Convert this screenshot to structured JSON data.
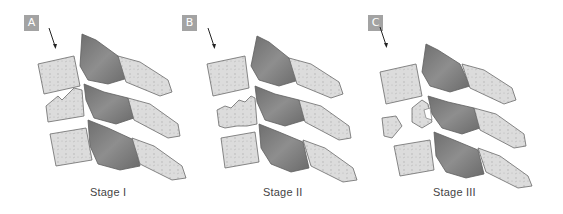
{
  "figure": {
    "colors": {
      "badge": "#a3a3a3",
      "bone_light": "#dcdcdc",
      "bone_dark": "#7d7d7d",
      "outline": "#6a6a6a",
      "caption": "#444444"
    },
    "panels": [
      {
        "id": "A",
        "badge": "A",
        "caption": "Stage  I",
        "stage": 1
      },
      {
        "id": "B",
        "badge": "B",
        "caption": "Stage  II",
        "stage": 2
      },
      {
        "id": "C",
        "badge": "C",
        "caption": "Stage  III",
        "stage": 3
      }
    ]
  }
}
